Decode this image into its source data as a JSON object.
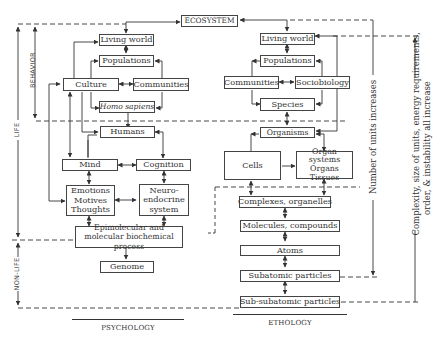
{
  "diagram": {
    "top": {
      "ecosystem": "ECOSYSTEM"
    },
    "side_labels": {
      "behavior": "BEHAVIOR",
      "life": "LIFE",
      "non_life": "NON-LIFE"
    },
    "psychology": {
      "heading": "PSYCHOLOGY",
      "boxes": {
        "living_world": "Living world",
        "populations": "Populations",
        "culture": "Culture",
        "communities": "Communities",
        "homo_sapiens": "Homo sapiens",
        "humans": "Humans",
        "mind": "Mind",
        "cognition": "Cognition",
        "emotions": "Emotions",
        "motives": "Motives",
        "thoughts": "Thoughts",
        "neuro_1": "Neuro-",
        "neuro_2": "endocrine",
        "neuro_3": "system",
        "epi_1": "Epimolecular and",
        "epi_2": "molecular biochemical process",
        "genome": "Genome"
      }
    },
    "ethology": {
      "heading": "ETHOLOGY",
      "boxes": {
        "living_world": "Living world",
        "populations": "Populations",
        "communities": "Communities",
        "sociobiology": "Sociobiology",
        "species": "Species",
        "organisms": "Organisms",
        "cells": "Cells",
        "organ_1": "Organ systems",
        "organ_2": "Organs",
        "organ_3": "Tissues",
        "complexes": "Complexes, organelles",
        "molecules": "Molecules, compounds",
        "atoms": "Atoms",
        "subatomic": "Subatomic particles",
        "sub_subatomic": "Sub-subatomic particles"
      }
    },
    "right_labels": {
      "units": "Number of units increases",
      "complexity_1": "Complexity, size of units, energy requirements,",
      "complexity_2": "order, & instability all increase"
    }
  }
}
